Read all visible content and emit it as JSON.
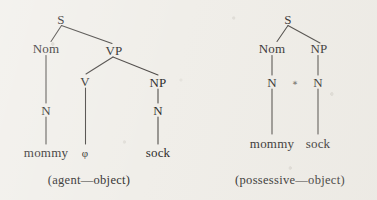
{
  "figure": {
    "background_color": "#f0eee9",
    "ink_color": "#2e2c2b",
    "line_color": "#4a4744"
  },
  "trees": [
    {
      "id": "agent-object-tree",
      "caption": "(agent—object)",
      "nodes": {
        "s": "S",
        "nom": "Nom",
        "vp": "VP",
        "v": "V",
        "np": "NP",
        "n_left": "N",
        "n_right": "N"
      },
      "terminals": {
        "mommy": "mommy",
        "null_verb": "φ",
        "sock": "sock"
      }
    },
    {
      "id": "possessive-object-tree",
      "caption": "(possessive—object)",
      "nodes": {
        "s": "S",
        "nom": "Nom",
        "np": "NP",
        "n_left": "N",
        "n_right": "N"
      },
      "marker": "⁎",
      "terminals": {
        "mommy": "mommy",
        "sock": "sock"
      }
    }
  ]
}
